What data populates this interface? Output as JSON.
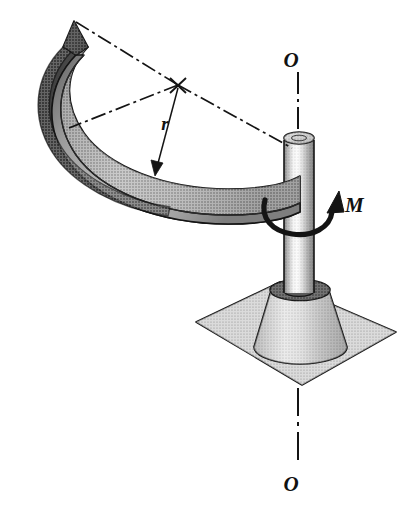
{
  "figure": {
    "background_color": "#ffffff",
    "outline_color": "#141414",
    "labels": {
      "axis_top": "O",
      "axis_bottom": "O",
      "moment": "M",
      "radius": "r"
    },
    "icons": {
      "moment_arrow": "curved-rotation-arrow-icon",
      "radius_arrow": "dimension-arrow-icon",
      "center_mark": "center-cross-icon",
      "axis_line": "dash-dot-axis-icon"
    },
    "colors": {
      "band_top_face": "#b9b9b9",
      "band_outer_face": "#8d8d8d",
      "band_inner_dark": "#4a4a4a",
      "band_end_dark": "#3d3d3d",
      "shaft_light": "#f0f0f0",
      "shaft_mid": "#a8a8a8",
      "shaft_dark": "#4f4f4f",
      "cone_light": "#d6d6d6",
      "cone_dark": "#7b7b7b",
      "cone_top_ring": "#6f6f6f",
      "plate_fill": "#b3b3b3",
      "outline": "#141414"
    },
    "geometry": {
      "shaft_center_x": 298,
      "shaft_top_y": 133,
      "shaft_bottom_y": 300,
      "shaft_half_width": 14,
      "band_radius_center": [
        178,
        85
      ],
      "plate_corners": "left(196,322) top(280,282) right(396,332) bottom(302,385)"
    },
    "components": [
      {
        "name": "curved-band",
        "description": "semicircular curved strip"
      },
      {
        "name": "vertical-shaft",
        "description": "cylindrical rod on axis O-O"
      },
      {
        "name": "conical-base",
        "description": "truncated cone hub"
      },
      {
        "name": "base-plate",
        "description": "square mounting plate in perspective"
      }
    ]
  }
}
